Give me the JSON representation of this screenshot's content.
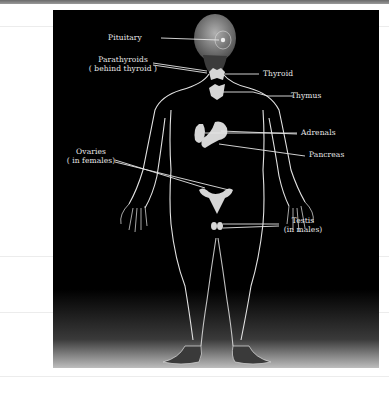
{
  "diagram": {
    "labels": {
      "pituitary": "Pituitary",
      "parathyroids_line1": "Parathyroids",
      "parathyroids_line2": "( behind thyroid )",
      "thyroid": "Thyroid",
      "thymus": "Thymus",
      "adrenals": "Adrenals",
      "pancreas": "Pancreas",
      "ovaries_line1": "Ovaries",
      "ovaries_line2": "( in females)",
      "testis_line1": "Testis",
      "testis_line2": "(in males)"
    },
    "colors": {
      "background": "#000000",
      "outline": "#e0e0e0",
      "gland": "#d8d8d8",
      "label_text": "#e8e8e8"
    }
  }
}
